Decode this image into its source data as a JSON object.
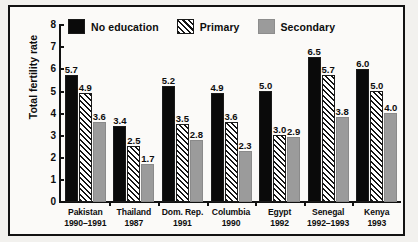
{
  "chart_data": {
    "type": "bar",
    "title": "",
    "xlabel": "",
    "ylabel": "Total fertility rate",
    "ylim": [
      0,
      8
    ],
    "yticks": [
      8,
      7,
      6,
      5,
      4,
      3,
      2,
      1,
      0
    ],
    "grid": false,
    "legend_position": "top",
    "categories": [
      "Pakistan 1990–1991",
      "Thailand 1987",
      "Dom. Rep. 1991",
      "Columbia 1990",
      "Egypt 1992",
      "Senegal 1992–1993",
      "Kenya 1993"
    ],
    "series": [
      {
        "name": "No education",
        "color": "#0a0a0a",
        "values": [
          5.7,
          3.4,
          5.2,
          4.9,
          5.0,
          6.5,
          6.0
        ]
      },
      {
        "name": "Primary",
        "color": "#ffffff",
        "values": [
          4.9,
          2.5,
          3.5,
          3.6,
          3.0,
          5.7,
          5.0
        ]
      },
      {
        "name": "Secondary",
        "color": "#9b9b9b",
        "values": [
          3.6,
          1.7,
          2.8,
          2.3,
          2.9,
          3.8,
          4.0
        ]
      }
    ]
  },
  "legend": {
    "items": [
      {
        "label": "No education",
        "swatch": "solid-black-swatch"
      },
      {
        "label": "Primary",
        "swatch": "hatched-swatch"
      },
      {
        "label": "Secondary",
        "swatch": "gray-swatch"
      }
    ]
  },
  "axis": {
    "y_title": "Total fertility rate",
    "y_ticks": [
      "8",
      "7",
      "6",
      "5",
      "4",
      "3",
      "2",
      "1",
      "0"
    ]
  },
  "x_groups": [
    {
      "country": "Pakistan",
      "year": "1990–1991"
    },
    {
      "country": "Thailand",
      "year": "1987"
    },
    {
      "country": "Dom. Rep.",
      "year": "1991"
    },
    {
      "country": "Columbia",
      "year": "1990"
    },
    {
      "country": "Egypt",
      "year": "1992"
    },
    {
      "country": "Senegal",
      "year": "1992–1993"
    },
    {
      "country": "Kenya",
      "year": "1993"
    }
  ],
  "bar_labels": {
    "pakistan": [
      "5.7",
      "4.9",
      "3.6"
    ],
    "thailand": [
      "3.4",
      "2.5",
      "1.7"
    ],
    "dom_rep": [
      "5.2",
      "3.5",
      "2.8"
    ],
    "columbia": [
      "4.9",
      "3.6",
      "2.3"
    ],
    "egypt": [
      "5.0",
      "3.0",
      "2.9"
    ],
    "senegal": [
      "6.5",
      "5.7",
      "3.8"
    ],
    "kenya": [
      "6.0",
      "5.0",
      "4.0"
    ]
  }
}
